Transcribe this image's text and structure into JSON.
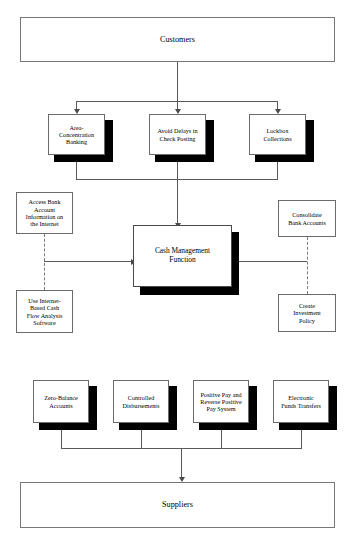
{
  "diagram": {
    "type": "flowchart",
    "top_endpoint": {
      "label": "Customers"
    },
    "bottom_endpoint": {
      "label": "Suppliers"
    },
    "center": {
      "label": "Cash Management\nFunction"
    },
    "collection_methods": [
      {
        "id": "area-concentration-banking",
        "label": "Area-\nConcentration\nBanking"
      },
      {
        "id": "avoid-delays-in-check-posting",
        "label": "Avoid Delays in\nCheck Posting"
      },
      {
        "id": "lockbox-collections",
        "label": "Lockbox\nCollections"
      }
    ],
    "left_supports": [
      {
        "id": "access-bank-account-information",
        "label": "Access Bank\nAccount\nInformation on\nthe Internet"
      },
      {
        "id": "internet-based-cash-flow-analysis",
        "label": "Use Internet-\nBased Cash\nFlow Analysis\nSoftware"
      }
    ],
    "right_supports": [
      {
        "id": "consolidate-bank-accounts",
        "label": "Consolidate\nBank Accounts"
      },
      {
        "id": "create-investment-policy",
        "label": "Create\nInvestment\nPolicy"
      }
    ],
    "disbursement_methods": [
      {
        "id": "zero-balance-accounts",
        "label": "Zero-Balance\nAccounts"
      },
      {
        "id": "controlled-disbursements",
        "label": "Controlled\nDisbursements"
      },
      {
        "id": "positive-pay-reverse-positive-pay",
        "label": "Positive Pay and\nReverse Positive\nPay System"
      },
      {
        "id": "electronic-funds-transfers",
        "label": "Electronic\nFunds Transfers"
      }
    ],
    "colors": {
      "background": "#ffffff",
      "box_border": "#6b6b6b",
      "shadow": "#000000",
      "connector": "#5a5a5a",
      "text": "#000000"
    }
  }
}
